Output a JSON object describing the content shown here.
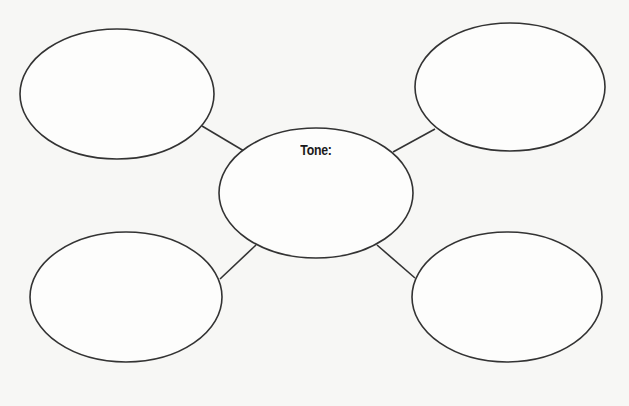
{
  "diagram": {
    "type": "web-organizer",
    "center": {
      "label": "Tone:"
    },
    "outer_nodes": [
      {
        "position": "top-left",
        "label": ""
      },
      {
        "position": "top-right",
        "label": ""
      },
      {
        "position": "bottom-left",
        "label": ""
      },
      {
        "position": "bottom-right",
        "label": ""
      }
    ],
    "colors": {
      "background": "#f7f7f5",
      "stroke": "#333333",
      "text": "#1a1a1a"
    }
  }
}
